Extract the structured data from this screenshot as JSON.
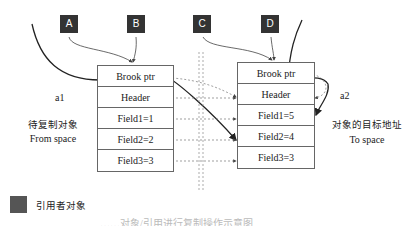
{
  "referrers": [
    {
      "id": "A"
    },
    {
      "id": "B"
    },
    {
      "id": "C"
    },
    {
      "id": "D"
    }
  ],
  "from_object": {
    "name": "a1",
    "label_cn": "待复制对象",
    "label_en": "From space",
    "rows": [
      "Brook ptr",
      "Header",
      "Field1=1",
      "Field2=2",
      "Field3=3"
    ]
  },
  "to_object": {
    "name": "a2",
    "label_cn": "对象的目标地址",
    "label_en": "To space",
    "rows": [
      "Brook ptr",
      "Header",
      "Field1=5",
      "Field2=4",
      "Field3=3"
    ]
  },
  "legend": {
    "label": "引用者对象",
    "color": "#555555"
  },
  "caption": "……对象/引用进行复制操作示意图"
}
